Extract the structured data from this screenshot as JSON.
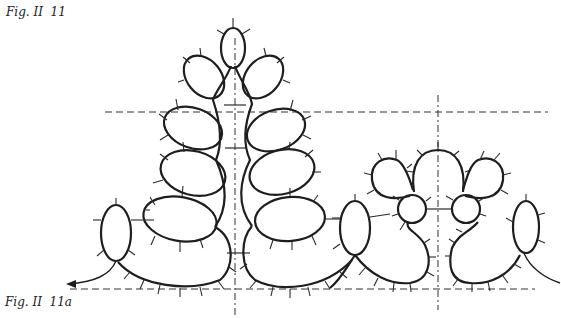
{
  "figure": {
    "caption_top": "Fig. II  11",
    "caption_bottom": "Fig. II  11a",
    "colors": {
      "line": "#1e1e1e",
      "background": "#ffffff"
    }
  },
  "diagram": {
    "motifs": [
      {
        "name": "leaf-spray",
        "description": "central stem with 9 oval rings (top ring plus 4 pairs) and 2 base chains"
      },
      {
        "name": "edging-repeat",
        "description": "scalloped motif with 2 small circular rings, 3 top chain loops, 2 side oval rings and 2 base chains"
      }
    ],
    "guides": {
      "horizontal": [
        "upper guide line",
        "base guide line"
      ],
      "vertical": [
        "leaf-spray axis",
        "edging-repeat axis"
      ]
    }
  }
}
